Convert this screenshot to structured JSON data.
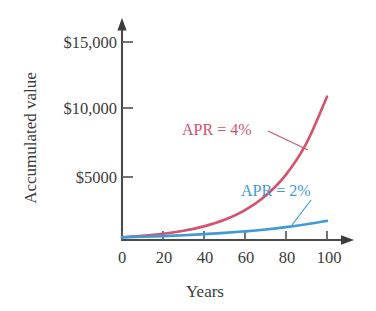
{
  "chart_data": {
    "type": "line",
    "title": "",
    "xlabel": "Years",
    "ylabel": "Accumulated value",
    "xlim": [
      0,
      105
    ],
    "ylim": [
      0,
      16500
    ],
    "grid": false,
    "legend_position": "inline-annotation",
    "x_ticks": [
      "0",
      "20",
      "40",
      "60",
      "80",
      "100"
    ],
    "x_tick_values": [
      0,
      20,
      40,
      60,
      80,
      100
    ],
    "y_ticks": [
      "$5000",
      "$10,000",
      "$15,000"
    ],
    "y_tick_values": [
      5000,
      10000,
      15000
    ],
    "x": [
      0,
      10,
      20,
      30,
      40,
      50,
      60,
      70,
      80,
      90,
      100
    ],
    "series": [
      {
        "name": "APR = 4%",
        "color": "#d4536c",
        "annotation": "APR = 4%",
        "values": [
          215,
          318,
          471,
          697,
          1032,
          1528,
          2262,
          3348,
          4956,
          7336,
          10860
        ]
      },
      {
        "name": "APR = 2%",
        "color": "#3f9bd6",
        "annotation": "APR = 2%",
        "values": [
          200,
          244,
          297,
          362,
          442,
          539,
          657,
          801,
          976,
          1190,
          1450
        ]
      }
    ]
  },
  "annotations": {
    "red_label": "APR = 4%",
    "blue_label": "APR = 2%"
  },
  "axes": {
    "x_title": "Years",
    "y_title": "Accumulated value"
  },
  "colors": {
    "red_series": "#d4536c",
    "blue_series": "#3f9bd6",
    "axis": "#4a4a4a",
    "text": "#3b3b3b",
    "background": "#ffffff"
  }
}
